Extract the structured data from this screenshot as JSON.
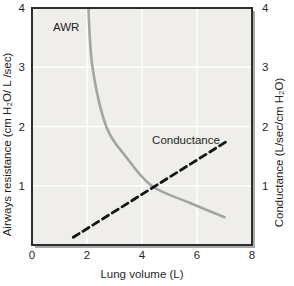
{
  "figure": {
    "title": ""
  },
  "chart_data": {
    "type": "line",
    "title": "",
    "xlabel": "Lung volume (L)",
    "ylabel_left": "Airways resistance (cm H₂O/ L /sec)",
    "ylabel_right": "Conductance (L/sec/cm H₂O)",
    "xlim": [
      0,
      8
    ],
    "ylim_left": [
      0,
      4
    ],
    "ylim_right": [
      0,
      4
    ],
    "xticks": [
      0,
      2,
      4,
      6,
      8
    ],
    "yticks_left": [
      4,
      3,
      2,
      1
    ],
    "yticks_right": [
      4,
      3,
      2,
      1
    ],
    "xgrid": [
      2,
      4,
      6
    ],
    "ygrid": [
      1,
      2,
      3
    ],
    "grid": true,
    "legend_position": "inline-annotations",
    "series": [
      {
        "name": "AWR",
        "axis": "left",
        "style": "solid",
        "color": "#a4a4a4",
        "width": 2.6,
        "points": [
          [
            2.05,
            4.0
          ],
          [
            2.2,
            3.0
          ],
          [
            2.7,
            2.0
          ],
          [
            3.4,
            1.5
          ],
          [
            4.35,
            1.0
          ],
          [
            5.75,
            0.71
          ],
          [
            7.0,
            0.47
          ]
        ]
      },
      {
        "name": "Conductance",
        "axis": "right",
        "style": "dashed",
        "dash": "7 4.5",
        "color": "#141414",
        "width": 2.8,
        "points": [
          [
            1.5,
            0.13
          ],
          [
            7.05,
            1.74
          ]
        ]
      }
    ],
    "annotations": [
      {
        "text": "AWR",
        "x": 1.24,
        "y": 3.68
      },
      {
        "text": "Conductance",
        "x": 5.6,
        "y": 1.78
      }
    ],
    "colors": {
      "plot_bg": "#efeeeb",
      "grid": "#ffffff",
      "border": "#2d2d2d",
      "shadow": "#a9a9a9",
      "text": "#1f1f1f"
    },
    "layout": {
      "plot_left": 32,
      "plot_top": 8,
      "plot_width": 220,
      "plot_height": 237,
      "shadow_offset": 3
    }
  }
}
